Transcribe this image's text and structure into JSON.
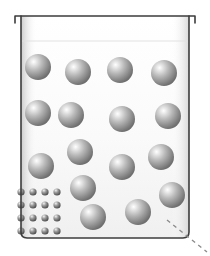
{
  "figure": {
    "title": "Beaker containing large spheres and a cluster of small particles",
    "caption": "",
    "background_color": "#ffffff"
  },
  "beaker": {
    "label": "beaker",
    "outline_color": "#3c3c3c",
    "outline_width": 1.6,
    "interior_fill_top": "#ffffff",
    "interior_fill_bottom": "#f0f0f0",
    "body": {
      "left": 21,
      "right": 189,
      "top": 16,
      "bottom": 238,
      "corner_radius": 6
    },
    "rim": {
      "label": "beaker-rim",
      "left": 15,
      "right": 195,
      "y": 16,
      "lip_drop": 7
    },
    "liquid_surface": {
      "label": "liquid-surface-line",
      "y": 41,
      "color": "#e2e2e2"
    }
  },
  "spheres": {
    "label": "large-sphere",
    "count": 15,
    "radius": 13,
    "fill_light": "#ffffff",
    "fill_mid": "#b9b9b9",
    "fill_dark": "#6f6f6f",
    "highlight_offset_x": -0.32,
    "highlight_offset_y": -0.34,
    "items": [
      {
        "cx": 38,
        "cy": 67
      },
      {
        "cx": 78,
        "cy": 72
      },
      {
        "cx": 120,
        "cy": 70
      },
      {
        "cx": 164,
        "cy": 73
      },
      {
        "cx": 38,
        "cy": 113
      },
      {
        "cx": 71,
        "cy": 115
      },
      {
        "cx": 122,
        "cy": 119
      },
      {
        "cx": 168,
        "cy": 116
      },
      {
        "cx": 80,
        "cy": 152
      },
      {
        "cx": 41,
        "cy": 166
      },
      {
        "cx": 122,
        "cy": 167
      },
      {
        "cx": 161,
        "cy": 157
      },
      {
        "cx": 83,
        "cy": 188
      },
      {
        "cx": 172,
        "cy": 195
      },
      {
        "cx": 93,
        "cy": 217
      },
      {
        "cx": 138,
        "cy": 212
      }
    ]
  },
  "particles": {
    "label": "small-particle-cluster",
    "count": 16,
    "rows": 4,
    "columns": 4,
    "radius": 3.6,
    "origin_x": 21,
    "origin_y": 192,
    "spacing_x": 12,
    "spacing_y": 13,
    "fill_light": "#f2f2f2",
    "fill_mid": "#9a9a9a",
    "fill_dark": "#4a4a4a"
  },
  "dashed_line": {
    "label": "dashed-guide-line",
    "x1": 167,
    "y1": 220,
    "x2": 207,
    "y2": 252,
    "color": "#8c8c8c",
    "width": 1.4,
    "dash": "4 4"
  }
}
